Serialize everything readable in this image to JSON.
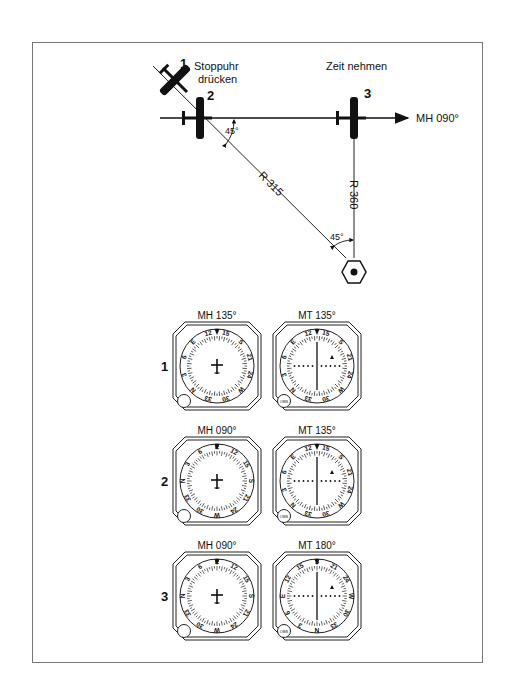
{
  "diagram": {
    "top_labels": {
      "stopwatch": [
        "Stoppuhr",
        "drücken"
      ],
      "take_time": "Zeit nehmen"
    },
    "positions": [
      {
        "id": "1",
        "label": "1"
      },
      {
        "id": "2",
        "label": "2"
      },
      {
        "id": "3",
        "label": "3"
      }
    ],
    "heading_label": "MH 090°",
    "radial_315": "R 315",
    "radial_360": "R 360",
    "angle_top": "45°",
    "angle_bottom": "45°"
  },
  "instruments": {
    "rows": [
      {
        "row_label": "1",
        "left_caption": "MH 135°",
        "right_caption": "MT 135°"
      },
      {
        "row_label": "2",
        "left_caption": "MH 090°",
        "right_caption": "MT 135°"
      },
      {
        "row_label": "3",
        "left_caption": "MH 090°",
        "right_caption": "MT 180°"
      }
    ],
    "obs_label": "OBS"
  }
}
